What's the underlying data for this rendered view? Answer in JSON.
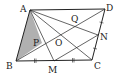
{
  "diagram": {
    "type": "geometry",
    "shape": "parallelogram ABCD",
    "colors": {
      "line": "#222222",
      "shade": "#b0b0b0",
      "background": "#ffffff"
    },
    "points": {
      "A": {
        "label": "A",
        "x": 30,
        "y": 10
      },
      "B": {
        "label": "B",
        "x": 16,
        "y": 61
      },
      "C": {
        "label": "C",
        "x": 92,
        "y": 60
      },
      "D": {
        "label": "D",
        "x": 105,
        "y": 9
      },
      "M": {
        "label": "M",
        "x": 54,
        "y": 61
      },
      "N": {
        "label": "N",
        "x": 98,
        "y": 35
      },
      "O": {
        "label": "O",
        "x": 61,
        "y": 35
      },
      "P": {
        "label": "P",
        "x": 42,
        "y": 43
      },
      "Q": {
        "label": "Q",
        "x": 74,
        "y": 22
      }
    },
    "segments": [
      "AB",
      "BC",
      "CD",
      "DA",
      "AC",
      "BD",
      "AM",
      "AN",
      "MN"
    ],
    "shaded_region": "triangle ABP",
    "equal_marks": [
      "BM = MC",
      "CN = ND"
    ]
  }
}
